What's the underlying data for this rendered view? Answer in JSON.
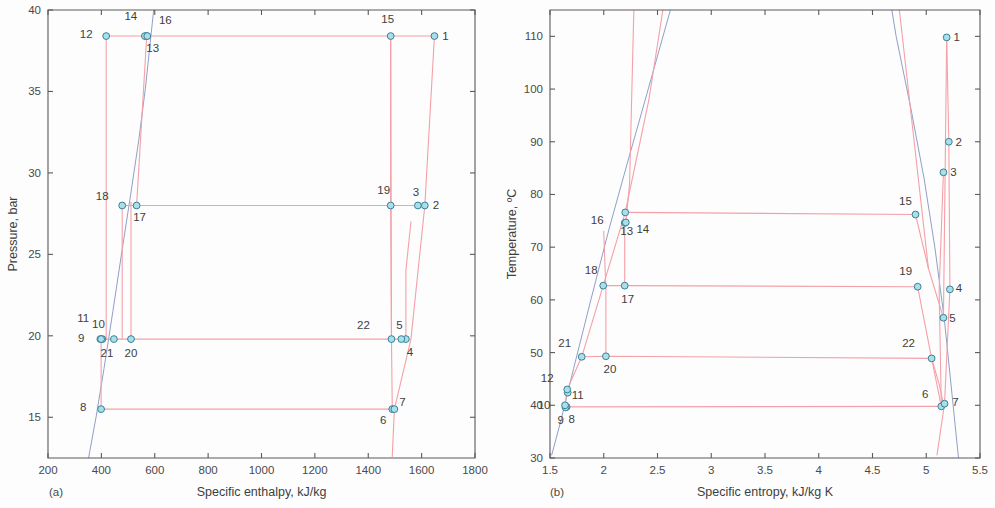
{
  "figure": {
    "width": 995,
    "height": 508,
    "background": "#fdfdfd",
    "cycle_color": "#f4a0a8",
    "saturation_color": "#8f9fc6",
    "marker_fill": "#a8e0e8",
    "marker_stroke": "#3a7f99",
    "axis_color": "#5a5a5a"
  },
  "chart_data": [
    {
      "type": "scatter",
      "panel": "a",
      "caption": "(a)",
      "title": "",
      "xlabel": "Specific enthalpy, kJ/kg",
      "ylabel": "Pressure, bar",
      "xlim": [
        200,
        1800
      ],
      "ylim": [
        12.5,
        40
      ],
      "xticks": [
        200,
        400,
        600,
        800,
        1000,
        1200,
        1400,
        1600,
        1800
      ],
      "yticks": [
        15,
        20,
        25,
        30,
        35,
        40
      ],
      "xtick_labels": [
        "200",
        "400",
        "600",
        "800",
        "1000",
        "1200",
        "1400",
        "1600",
        "1800"
      ],
      "ytick_labels": [
        "15",
        "20",
        "25",
        "30",
        "35",
        "40"
      ],
      "grid": false,
      "legend": "none",
      "points": [
        {
          "id": "1",
          "x": 1648,
          "y": 38.4,
          "label_dx": 11,
          "label_dy": 4
        },
        {
          "id": "2",
          "x": 1612,
          "y": 28.0,
          "label_dx": 11,
          "label_dy": 4
        },
        {
          "id": "3",
          "x": 1586,
          "y": 28.0,
          "label_dx": -2,
          "label_dy": -9
        },
        {
          "id": "4",
          "x": 1541,
          "y": 19.8,
          "label_dx": 4,
          "label_dy": 17
        },
        {
          "id": "5",
          "x": 1524,
          "y": 19.8,
          "label_dx": -2,
          "label_dy": -10
        },
        {
          "id": "6",
          "x": 1490,
          "y": 15.5,
          "label_dx": -9,
          "label_dy": 15
        },
        {
          "id": "7",
          "x": 1498,
          "y": 15.5,
          "label_dx": 8,
          "label_dy": -3
        },
        {
          "id": "8",
          "x": 399,
          "y": 15.5,
          "label_dx": -18,
          "label_dy": 2
        },
        {
          "id": "9",
          "x": 396,
          "y": 19.8,
          "label_dx": -19,
          "label_dy": 3
        },
        {
          "id": "10",
          "x": 404,
          "y": 19.8,
          "label_dx": -4,
          "label_dy": -11
        },
        {
          "id": "11",
          "x": 399,
          "y": 19.8,
          "label_dx": -18,
          "label_dy": -17
        },
        {
          "id": "12",
          "x": 418,
          "y": 38.4,
          "label_dx": -20,
          "label_dy": 2
        },
        {
          "id": "13",
          "x": 570,
          "y": 38.4,
          "label_dx": 6,
          "label_dy": 16
        },
        {
          "id": "14",
          "x": 563,
          "y": 38.4,
          "label_dx": -14,
          "label_dy": -16
        },
        {
          "id": "15",
          "x": 1484,
          "y": 38.4,
          "label_dx": -3,
          "label_dy": -13
        },
        {
          "id": "16",
          "x": 572,
          "y": 38.4,
          "label_dx": 18,
          "label_dy": -12
        },
        {
          "id": "17",
          "x": 532,
          "y": 28.0,
          "label_dx": 3,
          "label_dy": 16
        },
        {
          "id": "18",
          "x": 478,
          "y": 28.0,
          "label_dx": -20,
          "label_dy": -5
        },
        {
          "id": "19",
          "x": 1484,
          "y": 28.0,
          "label_dx": -7,
          "label_dy": -11
        },
        {
          "id": "20",
          "x": 511,
          "y": 19.8,
          "label_dx": 0,
          "label_dy": 18
        },
        {
          "id": "21",
          "x": 447,
          "y": 19.8,
          "label_dx": -7,
          "label_dy": 18
        },
        {
          "id": "22",
          "x": 1487,
          "y": 19.8,
          "label_dx": -28,
          "label_dy": -10
        }
      ],
      "cycle_paths": [
        [
          [
            418,
            38.4
          ],
          [
            570,
            38.4
          ],
          [
            1484,
            38.4
          ],
          [
            1648,
            38.4
          ]
        ],
        [
          [
            478,
            28.0
          ],
          [
            532,
            28.0
          ],
          [
            1484,
            28.0
          ],
          [
            1586,
            28.0
          ],
          [
            1612,
            28.0
          ]
        ],
        [
          [
            396,
            19.8
          ],
          [
            447,
            19.8
          ],
          [
            511,
            19.8
          ],
          [
            1487,
            19.8
          ],
          [
            1524,
            19.8
          ],
          [
            1541,
            19.8
          ]
        ],
        [
          [
            399,
            15.5
          ],
          [
            1490,
            15.5
          ],
          [
            1498,
            15.5
          ]
        ],
        [
          [
            418,
            38.4
          ],
          [
            418,
            33.6
          ],
          [
            418,
            19.8
          ]
        ],
        [
          [
            570,
            38.4
          ],
          [
            532,
            28.0
          ]
        ],
        [
          [
            1484,
            38.4
          ],
          [
            1487,
            19.8
          ]
        ],
        [
          [
            1648,
            38.4
          ],
          [
            1612,
            28.0
          ],
          [
            1560,
            19.8
          ],
          [
            1498,
            15.5
          ],
          [
            1490,
            12.6
          ]
        ],
        [
          [
            478,
            28.0
          ],
          [
            478,
            19.8
          ]
        ],
        [
          [
            399,
            19.8
          ],
          [
            399,
            15.5
          ]
        ],
        [
          [
            1541,
            19.8
          ],
          [
            1541,
            24.0
          ],
          [
            1560,
            27.0
          ]
        ],
        [
          [
            1490,
            15.5
          ],
          [
            1487,
            19.8
          ],
          [
            1484,
            28.0
          ],
          [
            1484,
            38.4
          ]
        ],
        [
          [
            511,
            19.8
          ],
          [
            511,
            24.0
          ],
          [
            511,
            28.2
          ]
        ]
      ],
      "saturation_paths": [
        [
          [
            352,
            12.5
          ],
          [
            380,
            15.0
          ],
          [
            410,
            18.0
          ],
          [
            443,
            21.5
          ],
          [
            478,
            25.3
          ],
          [
            510,
            28.7
          ],
          [
            540,
            32.0
          ],
          [
            565,
            35.2
          ],
          [
            583,
            38.0
          ],
          [
            596,
            40.0
          ]
        ]
      ]
    },
    {
      "type": "scatter",
      "panel": "b",
      "caption": "(b)",
      "title": "",
      "xlabel": "Specific entropy, kJ/kg K",
      "ylabel": "Temperature, ºC",
      "xlim": [
        1.5,
        5.5
      ],
      "ylim": [
        30,
        115
      ],
      "xticks": [
        1.5,
        2,
        2.5,
        3,
        3.5,
        4,
        4.5,
        5,
        5.5
      ],
      "yticks": [
        30,
        40,
        50,
        60,
        70,
        80,
        90,
        100,
        110
      ],
      "xtick_labels": [
        "1.5",
        "2",
        "2.5",
        "3",
        "3.5",
        "4",
        "4.5",
        "5",
        "5.5"
      ],
      "ytick_labels": [
        "30",
        "40",
        "50",
        "60",
        "70",
        "80",
        "90",
        "100",
        "110"
      ],
      "grid": false,
      "legend": "none",
      "points": [
        {
          "id": "1",
          "x": 5.19,
          "y": 109.8,
          "label_dx": 10,
          "label_dy": 4
        },
        {
          "id": "2",
          "x": 5.21,
          "y": 90.0,
          "label_dx": 10,
          "label_dy": 4
        },
        {
          "id": "3",
          "x": 5.16,
          "y": 84.2,
          "label_dx": 10,
          "label_dy": 4
        },
        {
          "id": "4",
          "x": 5.22,
          "y": 62.0,
          "label_dx": 9,
          "label_dy": 3
        },
        {
          "id": "5",
          "x": 5.16,
          "y": 56.6,
          "label_dx": 9,
          "label_dy": 4
        },
        {
          "id": "6",
          "x": 5.14,
          "y": 39.8,
          "label_dx": -16,
          "label_dy": -8
        },
        {
          "id": "7",
          "x": 5.17,
          "y": 40.3,
          "label_dx": 11,
          "label_dy": 2
        },
        {
          "id": "8",
          "x": 1.655,
          "y": 39.7,
          "label_dx": 5,
          "label_dy": 16
        },
        {
          "id": "9",
          "x": 1.645,
          "y": 39.6,
          "label_dx": -5,
          "label_dy": 17
        },
        {
          "id": "10",
          "x": 1.64,
          "y": 40.0,
          "label_dx": -21,
          "label_dy": 4
        },
        {
          "id": "11",
          "x": 1.665,
          "y": 42.4,
          "label_dx": 10,
          "label_dy": 6
        },
        {
          "id": "12",
          "x": 1.66,
          "y": 43.0,
          "label_dx": -20,
          "label_dy": -7
        },
        {
          "id": "13",
          "x": 2.195,
          "y": 74.6,
          "label_dx": 2,
          "label_dy": 12
        },
        {
          "id": "14",
          "x": 2.205,
          "y": 74.7,
          "label_dx": 17,
          "label_dy": 11
        },
        {
          "id": "15",
          "x": 4.9,
          "y": 76.2,
          "label_dx": -10,
          "label_dy": -10
        },
        {
          "id": "16",
          "x": 2.2,
          "y": 76.6,
          "label_dx": -28,
          "label_dy": 12
        },
        {
          "id": "17",
          "x": 2.195,
          "y": 62.7,
          "label_dx": 3,
          "label_dy": 17
        },
        {
          "id": "18",
          "x": 1.995,
          "y": 62.7,
          "label_dx": -12,
          "label_dy": -12
        },
        {
          "id": "19",
          "x": 4.92,
          "y": 62.5,
          "label_dx": -12,
          "label_dy": -12
        },
        {
          "id": "20",
          "x": 2.02,
          "y": 49.3,
          "label_dx": 4,
          "label_dy": 17
        },
        {
          "id": "21",
          "x": 1.795,
          "y": 49.2,
          "label_dx": -17,
          "label_dy": -10
        },
        {
          "id": "22",
          "x": 5.05,
          "y": 48.9,
          "label_dx": -23,
          "label_dy": -11
        }
      ],
      "cycle_paths": [
        [
          [
            2.2,
            76.6
          ],
          [
            4.9,
            76.2
          ]
        ],
        [
          [
            1.995,
            62.7
          ],
          [
            2.195,
            62.7
          ],
          [
            4.92,
            62.5
          ]
        ],
        [
          [
            1.795,
            49.2
          ],
          [
            2.02,
            49.3
          ],
          [
            5.05,
            48.9
          ]
        ],
        [
          [
            1.655,
            39.7
          ],
          [
            5.14,
            39.8
          ]
        ],
        [
          [
            1.64,
            40.0
          ],
          [
            1.66,
            43.0
          ],
          [
            1.795,
            49.2
          ],
          [
            1.995,
            62.7
          ],
          [
            2.2,
            76.6
          ],
          [
            2.42,
            98.0
          ],
          [
            2.55,
            115
          ]
        ],
        [
          [
            2.195,
            74.6
          ],
          [
            2.195,
            62.7
          ]
        ],
        [
          [
            2.205,
            74.7
          ],
          [
            2.24,
            82.0
          ],
          [
            2.28,
            115
          ]
        ],
        [
          [
            2.02,
            49.3
          ],
          [
            2.02,
            62.0
          ],
          [
            2.005,
            70.0
          ],
          [
            2.0,
            73.0
          ]
        ],
        [
          [
            4.9,
            76.2
          ],
          [
            5.02,
            66.0
          ],
          [
            5.16,
            56.6
          ],
          [
            5.19,
            109.8
          ]
        ],
        [
          [
            4.92,
            62.5
          ],
          [
            5.05,
            48.9
          ],
          [
            5.14,
            39.8
          ]
        ],
        [
          [
            5.19,
            109.8
          ],
          [
            5.21,
            90.0
          ],
          [
            5.22,
            62.0
          ],
          [
            5.17,
            40.3
          ],
          [
            5.1,
            30.6
          ]
        ],
        [
          [
            5.16,
            84.2
          ],
          [
            5.12,
            62.0
          ],
          [
            5.14,
            39.8
          ]
        ],
        [
          [
            5.05,
            48.9
          ],
          [
            5.12,
            44.0
          ],
          [
            5.16,
            40.2
          ]
        ],
        [
          [
            4.75,
            115
          ],
          [
            5.02,
            66.0
          ]
        ]
      ],
      "saturation_paths": [
        [
          [
            1.515,
            30.5
          ],
          [
            1.6,
            37.0
          ],
          [
            1.72,
            47.0
          ],
          [
            1.88,
            60.0
          ],
          [
            2.05,
            73.5
          ],
          [
            2.22,
            86.0
          ],
          [
            2.4,
            99.0
          ],
          [
            2.62,
            115
          ]
        ],
        [
          [
            5.3,
            30.0
          ],
          [
            5.24,
            42.0
          ],
          [
            5.17,
            56.0
          ],
          [
            5.08,
            70.0
          ],
          [
            4.98,
            83.0
          ],
          [
            4.86,
            96.0
          ],
          [
            4.72,
            110.0
          ],
          [
            4.68,
            115
          ]
        ]
      ]
    }
  ],
  "panels": {
    "a": {
      "caption": "(a)"
    },
    "b": {
      "caption": "(b)"
    }
  }
}
